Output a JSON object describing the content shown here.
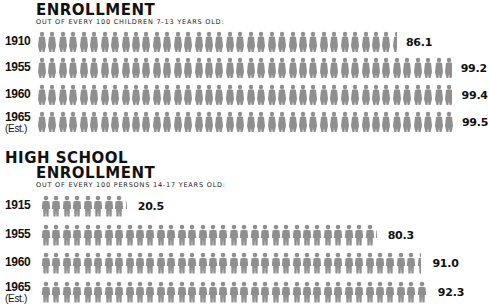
{
  "chart_data": [
    {
      "type": "bar",
      "subtype": "pictograph",
      "title": "ENROLLMENT",
      "subtitle": "OUT OF EVERY 100 CHILDREN 7-13 YEARS OLD:",
      "categories": [
        "1910",
        "1955",
        "1960",
        "1965 (Est.)"
      ],
      "values": [
        86.1,
        99.2,
        99.4,
        99.5
      ],
      "unit_per_figure": 2.5,
      "xlabel": "",
      "ylabel": "",
      "ylim": [
        0,
        100
      ]
    },
    {
      "type": "bar",
      "subtype": "pictograph",
      "title": "HIGH SCHOOL ENROLLMENT",
      "subtitle": "OUT OF EVERY 100 PERSONS 14-17 YEARS OLD:",
      "categories": [
        "1915",
        "1955",
        "1960",
        "1965 (Est.)"
      ],
      "values": [
        20.5,
        80.3,
        91.0,
        92.3
      ],
      "unit_per_figure": 2.5,
      "xlabel": "",
      "ylabel": "",
      "ylim": [
        0,
        100
      ]
    }
  ],
  "elementary": {
    "title": "ENROLLMENT",
    "subtitle": "OUT OF EVERY 100 CHILDREN 7-13 YEARS OLD:",
    "rows": [
      {
        "year": "1910",
        "est": "",
        "value": "86.1",
        "num": 86.1
      },
      {
        "year": "1955",
        "est": "",
        "value": "99.2",
        "num": 99.2
      },
      {
        "year": "1960",
        "est": "",
        "value": "99.4",
        "num": 99.4
      },
      {
        "year": "1965",
        "est": "(Est.)",
        "value": "99.5",
        "num": 99.5
      }
    ]
  },
  "highschool": {
    "title_line1": "HIGH SCHOOL",
    "title_line2": "ENROLLMENT",
    "subtitle": "OUT OF EVERY 100 PERSONS 14-17 YEARS OLD:",
    "rows": [
      {
        "year": "1915",
        "est": "",
        "value": "20.5",
        "num": 20.5
      },
      {
        "year": "1955",
        "est": "",
        "value": "80.3",
        "num": 80.3
      },
      {
        "year": "1960",
        "est": "",
        "value": "91.0",
        "num": 91.0
      },
      {
        "year": "1965",
        "est": "(Est.)",
        "value": "92.3",
        "num": 92.3
      }
    ]
  },
  "icons": {
    "figure": "person-icon"
  },
  "colors": {
    "figure": "#8f8f8f",
    "text": "#111111"
  }
}
